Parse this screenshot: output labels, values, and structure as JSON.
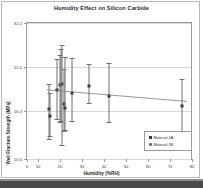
{
  "chart_data": {
    "type": "scatter",
    "title": "Humidity Effect on Silicon Carbide",
    "xlabel": "Humidity (%RH)",
    "ylabel": "Weil Fracture Strength (MPa)",
    "xlim": [
      5,
      80
    ],
    "ylim": [
      10.0,
      32.2
    ],
    "xticks": [
      5,
      10,
      20,
      30,
      40,
      50,
      60,
      70,
      80
    ],
    "xticklabels": [
      "5",
      "10",
      "20",
      "30",
      "40",
      "50",
      "60",
      "70",
      "80"
    ],
    "yticks": [
      10.0,
      16.3,
      22.0,
      32.2
    ],
    "yticklabels": [
      "32.2",
      "22.0",
      "16.3",
      "10.0"
    ],
    "grid": true,
    "legend_position": "lower-right",
    "series": [
      {
        "name": "Material 1A",
        "marker": "square",
        "color": "#3a3a3a",
        "points": [
          {
            "x": 15.0,
            "y": 18.4,
            "ylo": 13.6,
            "yhi": 22.4
          },
          {
            "x": 15.5,
            "y": 17.2,
            "ylo": 14.0,
            "yhi": 21.0
          },
          {
            "x": 18.5,
            "y": 21.4,
            "ylo": 16.8,
            "yhi": 26.4
          },
          {
            "x": 20.0,
            "y": 22.2,
            "ylo": 16.2,
            "yhi": 27.0
          },
          {
            "x": 21.0,
            "y": 22.4,
            "ylo": 12.6,
            "yhi": 28.6
          },
          {
            "x": 21.5,
            "y": 19.2,
            "ylo": 14.8,
            "yhi": 24.8
          },
          {
            "x": 22.0,
            "y": 18.6,
            "ylo": 15.0,
            "yhi": 26.8
          },
          {
            "x": 25.5,
            "y": 21.0,
            "ylo": 16.4,
            "yhi": 26.6
          },
          {
            "x": 33.0,
            "y": 22.0,
            "ylo": 19.4,
            "yhi": 25.6
          },
          {
            "x": 42.0,
            "y": 20.4,
            "ylo": 16.2,
            "yhi": 25.8
          },
          {
            "x": 75.0,
            "y": 18.8,
            "ylo": 14.4,
            "yhi": 23.2
          }
        ]
      },
      {
        "name": "Material 1B",
        "marker": "circle",
        "color": "#6a6a6a",
        "points": [
          {
            "x": 20.5,
            "y": 22.3,
            "ylo": 16.4,
            "yhi": 28.0
          }
        ]
      }
    ],
    "trendline": {
      "x0": 14.0,
      "y0": 21.3,
      "x1": 78.0,
      "y1": 19.4
    }
  },
  "legend": {
    "entries": [
      {
        "label": "Material 1A"
      },
      {
        "label": "Material 1B"
      }
    ]
  }
}
